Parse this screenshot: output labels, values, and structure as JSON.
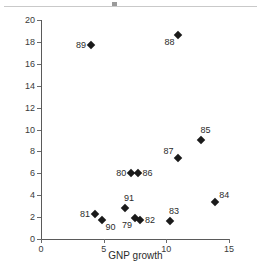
{
  "chart_data": {
    "type": "scatter",
    "title": "",
    "xlabel": "GNP growth",
    "ylabel": "Inflation",
    "xlim": [
      0,
      15
    ],
    "ylim": [
      0,
      20
    ],
    "xticks": [
      0,
      5,
      10,
      15
    ],
    "yticks": [
      0,
      2,
      4,
      6,
      8,
      10,
      12,
      14,
      16,
      18,
      20
    ],
    "grid": false,
    "legend": null,
    "marker": "filled-diamond",
    "marker_color": "#1a1a1a",
    "points": [
      {
        "label": "79",
        "x": 7.5,
        "y": 1.9,
        "label_pos": "below-left"
      },
      {
        "label": "80",
        "x": 7.2,
        "y": 6.0,
        "label_pos": "left"
      },
      {
        "label": "81",
        "x": 4.3,
        "y": 2.3,
        "label_pos": "left"
      },
      {
        "label": "82",
        "x": 7.9,
        "y": 1.75,
        "label_pos": "right"
      },
      {
        "label": "83",
        "x": 10.3,
        "y": 1.65,
        "label_pos": "above"
      },
      {
        "label": "84",
        "x": 13.9,
        "y": 3.35,
        "label_pos": "above-right"
      },
      {
        "label": "85",
        "x": 12.8,
        "y": 9.0,
        "label_pos": "above"
      },
      {
        "label": "86",
        "x": 7.7,
        "y": 6.05,
        "label_pos": "right"
      },
      {
        "label": "87",
        "x": 10.9,
        "y": 7.4,
        "label_pos": "above-left"
      },
      {
        "label": "88",
        "x": 10.9,
        "y": 18.6,
        "label_pos": "below-left"
      },
      {
        "label": "89",
        "x": 4.0,
        "y": 17.7,
        "label_pos": "left"
      },
      {
        "label": "90",
        "x": 4.9,
        "y": 1.75,
        "label_pos": "below-right"
      },
      {
        "label": "91",
        "x": 6.7,
        "y": 2.85,
        "label_pos": "above"
      }
    ]
  }
}
